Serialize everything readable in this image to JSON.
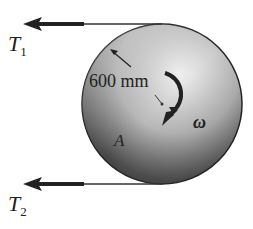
{
  "diagram": {
    "type": "pulley-disk",
    "disk": {
      "label": "A",
      "radius_label": "600 mm",
      "fill_dark": "#3a3a3a",
      "fill_light": "#e8e8e8"
    },
    "forces": [
      {
        "id": "T1",
        "symbol": "T",
        "subscript": "1",
        "position": "top"
      },
      {
        "id": "T2",
        "symbol": "T",
        "subscript": "2",
        "position": "bottom"
      }
    ],
    "angular_velocity": {
      "symbol": "ω",
      "direction": "clockwise"
    }
  }
}
